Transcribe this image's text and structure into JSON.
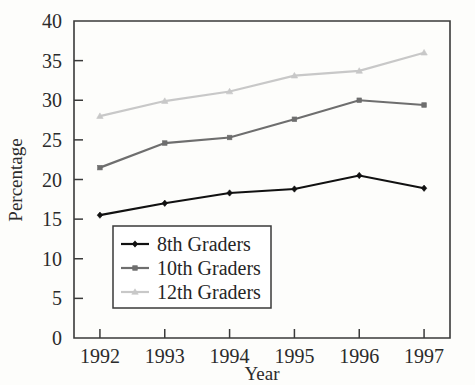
{
  "chart_data": {
    "type": "line",
    "title": "",
    "xlabel": "Year",
    "ylabel": "Percentage",
    "categories": [
      "1992",
      "1993",
      "1994",
      "1995",
      "1996",
      "1997"
    ],
    "x": [
      1992,
      1993,
      1994,
      1995,
      1996,
      1997
    ],
    "xlim": [
      1991.6,
      1997.4
    ],
    "ylim": [
      0,
      40
    ],
    "yticks": [
      0,
      5,
      10,
      15,
      20,
      25,
      30,
      35,
      40
    ],
    "ytick_labels": [
      "0",
      "5",
      "10",
      "15",
      "20",
      "25",
      "30",
      "35",
      "40"
    ],
    "grid": false,
    "legend_position": "lower-left-inside",
    "series": [
      {
        "name": "8th Graders",
        "values": [
          15.5,
          17.0,
          18.3,
          18.8,
          20.5,
          18.9
        ],
        "color": "#111111",
        "marker": "diamond"
      },
      {
        "name": "10th Graders",
        "values": [
          21.5,
          24.6,
          25.3,
          27.6,
          30.0,
          29.4
        ],
        "color": "#6e6e6e",
        "marker": "square"
      },
      {
        "name": "12th Graders",
        "values": [
          28.0,
          29.9,
          31.1,
          33.1,
          33.7,
          36.0
        ],
        "color": "#c8c8c8",
        "marker": "triangle"
      }
    ]
  },
  "legend": {
    "items": [
      {
        "label": "8th Graders"
      },
      {
        "label": "10th Graders"
      },
      {
        "label": "12th Graders"
      }
    ]
  },
  "axes": {
    "y_title": "Percentage",
    "x_title": "Year"
  }
}
